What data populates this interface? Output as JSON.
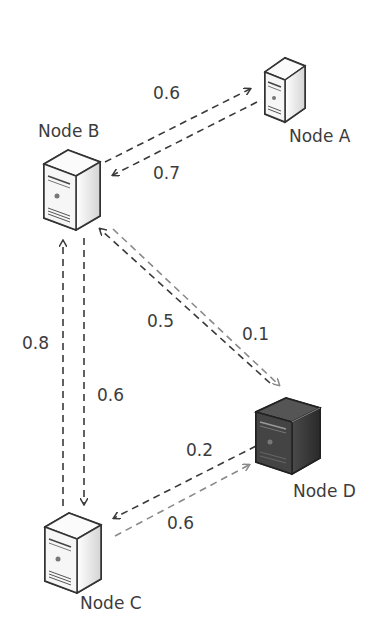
{
  "diagram": {
    "type": "network-weighted-graph",
    "nodes": [
      {
        "id": "A",
        "label": "Node A",
        "style": "light"
      },
      {
        "id": "B",
        "label": "Node B",
        "style": "light"
      },
      {
        "id": "C",
        "label": "Node C",
        "style": "light"
      },
      {
        "id": "D",
        "label": "Node D",
        "style": "dark"
      }
    ],
    "edges": [
      {
        "from": "B",
        "to": "A",
        "weight": "0.6"
      },
      {
        "from": "A",
        "to": "B",
        "weight": "0.7"
      },
      {
        "from": "D",
        "to": "B",
        "weight": "0.5"
      },
      {
        "from": "B",
        "to": "D",
        "weight": "0.1"
      },
      {
        "from": "C",
        "to": "B",
        "weight": "0.8"
      },
      {
        "from": "B",
        "to": "C",
        "weight": "0.6"
      },
      {
        "from": "D",
        "to": "C",
        "weight": "0.2"
      },
      {
        "from": "C",
        "to": "D",
        "weight": "0.6"
      }
    ]
  },
  "labels": {
    "node_a": "Node A",
    "node_b": "Node B",
    "node_c": "Node C",
    "node_d": "Node D",
    "w_ba": "0.6",
    "w_ab": "0.7",
    "w_db": "0.5",
    "w_bd": "0.1",
    "w_cb": "0.8",
    "w_bc": "0.6",
    "w_dc": "0.2",
    "w_cd": "0.6"
  },
  "colors": {
    "edge_dark": "#3a3a3a",
    "edge_light": "#8a8a8a",
    "server_light": "#f2f2f2",
    "server_dark": "#3b3b3b"
  }
}
